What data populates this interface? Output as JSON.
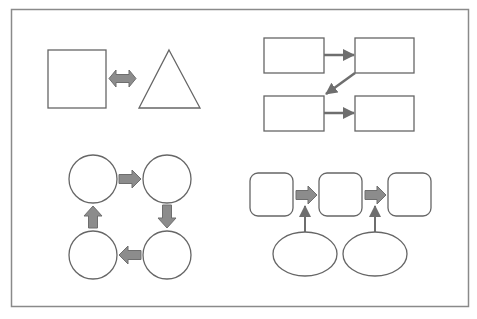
{
  "page": {
    "width": 477,
    "height": 319,
    "background": "#ffffff"
  },
  "colors": {
    "frame": "#8a8a8a",
    "stroke": "#666666",
    "arrow_fill": "#8c8c8c",
    "arrow_stroke": "#6e6e6e",
    "shape_fill": "#ffffff"
  },
  "diagram": {
    "frame": {
      "x": 11,
      "y": 9,
      "width": 458,
      "height": 298
    },
    "quadrants": [
      {
        "name": "square-triangle-bidirectional",
        "nodes": [
          {
            "id": "square",
            "shape": "square",
            "x": 48,
            "y": 50,
            "w": 58,
            "h": 58
          },
          {
            "id": "triangle",
            "shape": "triangle",
            "points": [
              [
                169,
                50
              ],
              [
                200,
                108
              ],
              [
                139,
                108
              ]
            ]
          }
        ],
        "edges": [
          {
            "from": "square",
            "to": "triangle",
            "type": "double-block-arrow"
          }
        ]
      },
      {
        "name": "four-rectangles-zigzag",
        "nodes": [
          {
            "id": "r1",
            "shape": "rect",
            "x": 264,
            "y": 38,
            "w": 60,
            "h": 35
          },
          {
            "id": "r2",
            "shape": "rect",
            "x": 355,
            "y": 38,
            "w": 59,
            "h": 35
          },
          {
            "id": "r3",
            "shape": "rect",
            "x": 264,
            "y": 96,
            "w": 60,
            "h": 35
          },
          {
            "id": "r4",
            "shape": "rect",
            "x": 355,
            "y": 96,
            "w": 59,
            "h": 35
          }
        ],
        "edges": [
          {
            "from": "r1",
            "to": "r2",
            "type": "line-arrow"
          },
          {
            "from": "r2",
            "to": "r3",
            "type": "line-arrow-diagonal"
          },
          {
            "from": "r3",
            "to": "r4",
            "type": "line-arrow"
          }
        ]
      },
      {
        "name": "four-circles-cycle",
        "nodes": [
          {
            "id": "c1",
            "shape": "circle",
            "cx": 93,
            "cy": 179,
            "r": 24
          },
          {
            "id": "c2",
            "shape": "circle",
            "cx": 167,
            "cy": 179,
            "r": 24
          },
          {
            "id": "c3",
            "shape": "circle",
            "cx": 167,
            "cy": 255,
            "r": 24
          },
          {
            "id": "c4",
            "shape": "circle",
            "cx": 93,
            "cy": 255,
            "r": 24
          }
        ],
        "edges": [
          {
            "from": "c1",
            "to": "c2",
            "type": "block-arrow-right"
          },
          {
            "from": "c2",
            "to": "c3",
            "type": "block-arrow-down"
          },
          {
            "from": "c3",
            "to": "c4",
            "type": "block-arrow-left"
          },
          {
            "from": "c4",
            "to": "c1",
            "type": "block-arrow-up"
          }
        ]
      },
      {
        "name": "process-with-inputs",
        "nodes": [
          {
            "id": "s1",
            "shape": "rounded-square",
            "x": 250,
            "y": 173,
            "w": 43,
            "h": 43,
            "rx": 8
          },
          {
            "id": "s2",
            "shape": "rounded-square",
            "x": 319,
            "y": 173,
            "w": 43,
            "h": 43,
            "rx": 8
          },
          {
            "id": "s3",
            "shape": "rounded-square",
            "x": 388,
            "y": 173,
            "w": 43,
            "h": 43,
            "rx": 8
          },
          {
            "id": "e1",
            "shape": "ellipse",
            "cx": 305,
            "cy": 254,
            "rx": 32,
            "ry": 22
          },
          {
            "id": "e2",
            "shape": "ellipse",
            "cx": 375,
            "cy": 254,
            "rx": 32,
            "ry": 22
          }
        ],
        "edges": [
          {
            "from": "s1",
            "to": "s2",
            "type": "block-arrow-right"
          },
          {
            "from": "s2",
            "to": "s3",
            "type": "block-arrow-right"
          },
          {
            "from": "e1",
            "to": "s1-s2-arrow",
            "type": "line-arrow-up"
          },
          {
            "from": "e2",
            "to": "s2-s3-arrow",
            "type": "line-arrow-up"
          }
        ]
      }
    ]
  }
}
